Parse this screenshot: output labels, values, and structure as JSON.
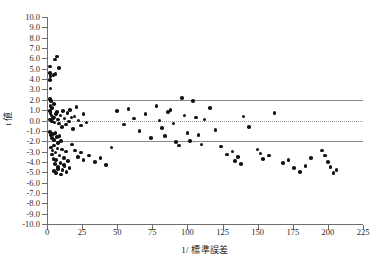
{
  "chart_data": {
    "type": "scatter",
    "title": "",
    "xlabel": "1/ 標準誤差",
    "ylabel": "t 値",
    "xlim": [
      0,
      225
    ],
    "ylim": [
      -10,
      10
    ],
    "xticks": [
      0,
      25,
      50,
      75,
      100,
      125,
      150,
      175,
      200,
      225
    ],
    "xtick_labels": [
      "0",
      "25",
      "50",
      "75",
      "100",
      "125",
      "150",
      "175",
      "200",
      "225"
    ],
    "yticks": [
      10,
      9,
      8,
      7,
      6,
      5,
      4,
      3,
      2,
      1,
      0,
      -1,
      -2,
      -3,
      -4,
      -5,
      -6,
      -7,
      -8,
      -9,
      -10
    ],
    "ytick_labels": [
      "10.0",
      "9.0",
      "8.0",
      "7.0",
      "6.0",
      "5.0",
      "4.0",
      "3.0",
      "2.0",
      "1.0",
      "0.0",
      "-1.0",
      "-2.0",
      "-3.0",
      "-4.0",
      "-5.0",
      "-6.0",
      "-7.0",
      "-8.0",
      "-9.0",
      "-10.0"
    ],
    "grid": false,
    "legend": false,
    "reference_lines": [
      {
        "name": "upper-significance-line",
        "y": 1.96,
        "style": "solid",
        "color": "#8a8a8a"
      },
      {
        "name": "lower-significance-line",
        "y": -1.96,
        "style": "solid",
        "color": "#8a8a8a"
      },
      {
        "name": "zero-line",
        "y": 0,
        "style": "dotted",
        "color": "#9a9a9a"
      }
    ],
    "marker": {
      "shape": "circle",
      "color": "#111111",
      "size": 3.6
    },
    "series": [
      {
        "name": "studies",
        "points": [
          [
            2.0,
            5.2
          ],
          [
            2.2,
            4.6
          ],
          [
            2.4,
            4.3
          ],
          [
            2.0,
            3.9
          ],
          [
            2.6,
            3.1
          ],
          [
            5.5,
            5.9
          ],
          [
            7.0,
            6.2
          ],
          [
            8.5,
            5.1
          ],
          [
            6.0,
            4.5
          ],
          [
            4.5,
            4.4
          ],
          [
            2.0,
            2.1
          ],
          [
            3.0,
            1.9
          ],
          [
            2.5,
            1.4
          ],
          [
            3.5,
            1.2
          ],
          [
            5.0,
            1.6
          ],
          [
            2.0,
            0.9
          ],
          [
            2.6,
            0.7
          ],
          [
            3.2,
            0.5
          ],
          [
            4.0,
            0.4
          ],
          [
            5.0,
            0.3
          ],
          [
            2.0,
            0.1
          ],
          [
            2.8,
            0.0
          ],
          [
            3.6,
            -0.1
          ],
          [
            4.4,
            0.2
          ],
          [
            5.4,
            -0.2
          ],
          [
            6.2,
            0.6
          ],
          [
            7.0,
            0.8
          ],
          [
            7.8,
            0.1
          ],
          [
            8.6,
            -0.3
          ],
          [
            9.5,
            0.5
          ],
          [
            10.5,
            -0.6
          ],
          [
            11.5,
            0.9
          ],
          [
            12.5,
            0.2
          ],
          [
            13.5,
            -0.4
          ],
          [
            14.5,
            0.7
          ],
          [
            15.5,
            -0.1
          ],
          [
            16.5,
            1.0
          ],
          [
            17.5,
            0.3
          ],
          [
            18.5,
            -0.8
          ],
          [
            19.5,
            0.4
          ],
          [
            21.0,
            1.3
          ],
          [
            22.5,
            0.0
          ],
          [
            24.0,
            -0.5
          ],
          [
            26.0,
            0.6
          ],
          [
            28.0,
            -0.2
          ],
          [
            2.0,
            -1.1
          ],
          [
            2.8,
            -1.4
          ],
          [
            3.4,
            -1.7
          ],
          [
            4.2,
            -1.3
          ],
          [
            5.0,
            -1.9
          ],
          [
            6.0,
            -1.2
          ],
          [
            7.0,
            -1.6
          ],
          [
            8.0,
            -2.2
          ],
          [
            9.0,
            -1.5
          ],
          [
            10.0,
            -2.0
          ],
          [
            3.0,
            -2.6
          ],
          [
            4.0,
            -2.9
          ],
          [
            5.0,
            -2.4
          ],
          [
            6.0,
            -3.1
          ],
          [
            7.5,
            -2.7
          ],
          [
            9.0,
            -3.4
          ],
          [
            10.5,
            -2.8
          ],
          [
            12.0,
            -3.6
          ],
          [
            13.5,
            -3.0
          ],
          [
            15.0,
            -3.9
          ],
          [
            3.5,
            -3.3
          ],
          [
            4.5,
            -3.7
          ],
          [
            5.5,
            -4.2
          ],
          [
            6.5,
            -3.8
          ],
          [
            8.0,
            -4.5
          ],
          [
            9.5,
            -4.1
          ],
          [
            11.0,
            -4.8
          ],
          [
            12.5,
            -4.4
          ],
          [
            14.0,
            -5.0
          ],
          [
            16.0,
            -4.6
          ],
          [
            5.0,
            -4.9
          ],
          [
            6.5,
            -5.1
          ],
          [
            8.0,
            -4.7
          ],
          [
            10.0,
            -5.2
          ],
          [
            12.0,
            -4.3
          ],
          [
            18.0,
            -2.3
          ],
          [
            20.0,
            -2.9
          ],
          [
            22.0,
            -3.5
          ],
          [
            24.0,
            -3.1
          ],
          [
            26.0,
            -3.8
          ],
          [
            30.0,
            -3.4
          ],
          [
            34.0,
            -4.0
          ],
          [
            38.0,
            -3.6
          ],
          [
            42.0,
            -4.3
          ],
          [
            46.0,
            -2.6
          ],
          [
            50.0,
            0.9
          ],
          [
            55.0,
            -0.4
          ],
          [
            58.0,
            1.1
          ],
          [
            62.0,
            0.2
          ],
          [
            66.0,
            -1.0
          ],
          [
            70.0,
            0.6
          ],
          [
            74.0,
            -1.7
          ],
          [
            78.0,
            1.4
          ],
          [
            80.0,
            0.0
          ],
          [
            82.0,
            -0.7
          ],
          [
            84.0,
            -1.5
          ],
          [
            86.0,
            0.8
          ],
          [
            88.0,
            1.0
          ],
          [
            90.0,
            -0.3
          ],
          [
            92.0,
            -2.1
          ],
          [
            94.0,
            -2.4
          ],
          [
            96.0,
            2.2
          ],
          [
            98.0,
            0.5
          ],
          [
            100.0,
            -1.2
          ],
          [
            102.0,
            -2.0
          ],
          [
            104.0,
            1.9
          ],
          [
            106.0,
            0.3
          ],
          [
            108.0,
            -1.4
          ],
          [
            110.0,
            -2.3
          ],
          [
            112.0,
            0.1
          ],
          [
            116.0,
            1.2
          ],
          [
            120.0,
            -0.9
          ],
          [
            124.0,
            -2.5
          ],
          [
            128.0,
            -3.3
          ],
          [
            132.0,
            -3.0
          ],
          [
            134.0,
            -3.9
          ],
          [
            136.0,
            -3.5
          ],
          [
            138.0,
            -4.2
          ],
          [
            140.0,
            0.4
          ],
          [
            144.0,
            -0.6
          ],
          [
            150.0,
            -2.8
          ],
          [
            152.0,
            -3.2
          ],
          [
            154.0,
            -3.7
          ],
          [
            158.0,
            -3.4
          ],
          [
            162.0,
            0.7
          ],
          [
            168.0,
            -4.1
          ],
          [
            172.0,
            -3.8
          ],
          [
            176.0,
            -4.6
          ],
          [
            180.0,
            -5.0
          ],
          [
            184.0,
            -4.4
          ],
          [
            188.0,
            -3.6
          ],
          [
            196.0,
            -2.9
          ],
          [
            198.0,
            -3.4
          ],
          [
            200.0,
            -4.0
          ],
          [
            202.0,
            -4.5
          ],
          [
            204.0,
            -5.1
          ],
          [
            206.0,
            -4.8
          ]
        ]
      }
    ]
  }
}
